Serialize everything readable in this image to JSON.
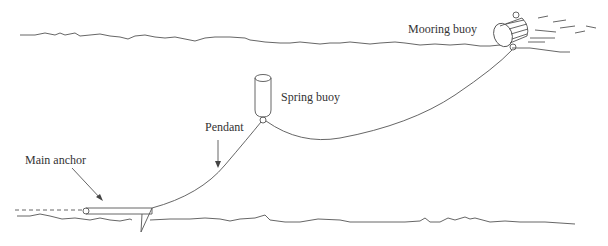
{
  "diagram": {
    "title": "",
    "labels": {
      "mooring_buoy": "Mooring buoy",
      "spring_buoy": "Spring buoy",
      "pendant": "Pendant",
      "main_anchor": "Main anchor"
    },
    "components": [
      {
        "id": "water-surface",
        "type": "wavy-line"
      },
      {
        "id": "mooring-buoy",
        "type": "cylinder-buoy",
        "label": "Mooring buoy"
      },
      {
        "id": "spring-buoy",
        "type": "cylinder-buoy",
        "label": "Spring buoy"
      },
      {
        "id": "riser-chain",
        "type": "curve",
        "from": "spring-buoy",
        "to": "mooring-buoy"
      },
      {
        "id": "pendant",
        "type": "curve",
        "from": "main-anchor",
        "to": "spring-buoy",
        "label": "Pendant"
      },
      {
        "id": "main-anchor",
        "type": "anchor",
        "label": "Main anchor"
      },
      {
        "id": "seabed",
        "type": "wavy-line"
      }
    ]
  }
}
